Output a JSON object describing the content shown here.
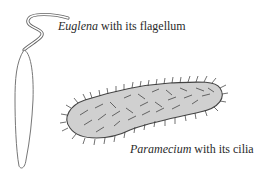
{
  "diagram": {
    "euglena": {
      "name": "Euglena",
      "caption_rest": " with its flagellum"
    },
    "paramecium": {
      "name": "Paramecium",
      "caption_rest": " with its cilia"
    },
    "colors": {
      "outline": "#555555",
      "paramecium_fill": "#d0d0d0",
      "cilia": "#444444",
      "text": "#2a2a2a"
    }
  }
}
